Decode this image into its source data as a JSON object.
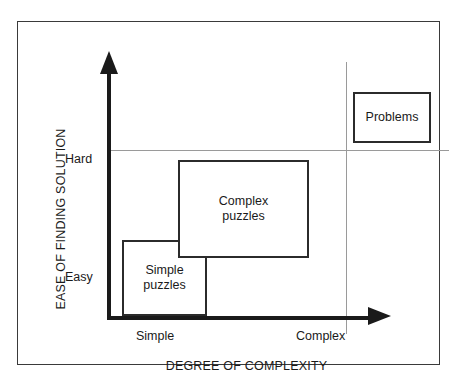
{
  "chart_data": {
    "type": "scatter",
    "title": "",
    "xlabel": "DEGREE OF COMPLEXITY",
    "ylabel": "EASE OF FINDING SOLUTION",
    "x_ticks": [
      "Simple",
      "Complex"
    ],
    "y_ticks": [
      "Easy",
      "Hard"
    ],
    "grid": true,
    "legend": "none",
    "annotations": [
      {
        "label": "Simple puzzles",
        "x": "Simple",
        "y": "Easy"
      },
      {
        "label": "Complex puzzles",
        "x": "Simple-Complex",
        "y": "Easy-Hard"
      },
      {
        "label": "Problems",
        "x": "Complex",
        "y": "Hard"
      }
    ],
    "regions": [
      {
        "name": "simple-puzzles",
        "label": "Simple\npuzzles",
        "x_range": [
          "Simple",
          "mid-low"
        ],
        "y_range": [
          "Easy",
          "low-mid"
        ]
      },
      {
        "name": "complex-puzzles",
        "label": "Complex\npuzzles",
        "x_range": [
          "mid-low",
          "mid-high"
        ],
        "y_range": [
          "low-mid",
          "Hard"
        ]
      },
      {
        "name": "problems",
        "label": "Problems",
        "x_range": [
          "Complex",
          "beyond"
        ],
        "y_range": [
          "Hard",
          "beyond"
        ]
      }
    ]
  },
  "figure": {
    "axes": {
      "y_title": "EASE OF FINDING SOLUTION",
      "x_title": "DEGREE OF COMPLEXITY",
      "y_tick_high": "Hard",
      "y_tick_low": "Easy",
      "x_tick_low": "Simple",
      "x_tick_high": "Complex"
    },
    "boxes": {
      "simple_puzzles": "Simple\npuzzles",
      "simple_puzzles_line1": "Simple",
      "simple_puzzles_line2": "puzzles",
      "complex_puzzles_line1": "Complex",
      "complex_puzzles_line2": "puzzles",
      "problems": "Problems"
    },
    "colors": {
      "ink": "#1a1a1a",
      "frame": "#3a3a3a",
      "box_border": "#2b2b2b",
      "guide": "#9a9a9a",
      "background": "#ffffff"
    }
  }
}
